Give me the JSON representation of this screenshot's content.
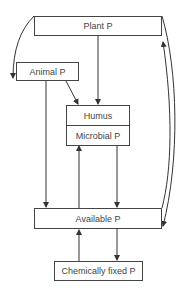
{
  "diagram": {
    "nodes": {
      "plant": "Plant P",
      "animal": "Animal P",
      "humus": "Humus",
      "microbial": "Microbial P",
      "available": "Available P",
      "fixed": "Chemically fixed P"
    },
    "edges": [
      {
        "from": "Plant P",
        "to": "Animal P"
      },
      {
        "from": "Plant P",
        "to": "Humus"
      },
      {
        "from": "Animal P",
        "to": "Humus"
      },
      {
        "from": "Animal P",
        "to": "Available P"
      },
      {
        "from": "Available P",
        "to": "Microbial P"
      },
      {
        "from": "Microbial P",
        "to": "Available P"
      },
      {
        "from": "Available P",
        "to": "Plant P"
      },
      {
        "from": "Plant P",
        "to": "Available P"
      },
      {
        "from": "Available P",
        "to": "Chemically fixed P"
      },
      {
        "from": "Chemically fixed P",
        "to": "Available P"
      }
    ]
  }
}
